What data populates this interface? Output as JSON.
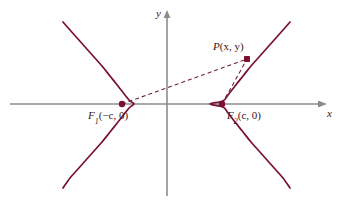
{
  "figure": {
    "background_color": "#ffffff",
    "curve_color": "#7a1030",
    "axis_color": "#8c8c8c",
    "dash_color": "#6b2233",
    "point_color": "#7a1030",
    "label_color": "#3a1520"
  },
  "axes": {
    "x_label": "x",
    "y_label": "y",
    "origin": {
      "x": 167,
      "y": 104
    },
    "x_axis": {
      "x1": 10,
      "x2": 322,
      "y": 104
    },
    "y_axis": {
      "x": 167,
      "y1": 12,
      "y2": 196
    }
  },
  "labels": {
    "focus_left": {
      "name": "F",
      "subscript": "1",
      "coords": "(−c, 0)",
      "full": "F₁(−c, 0)"
    },
    "focus_right": {
      "name": "F",
      "subscript": "2",
      "coords": "(c, 0)",
      "full": "F₂(c, 0)"
    },
    "point_p": {
      "name": "P",
      "coords": "(x, y)",
      "full": "P(x, y)"
    }
  },
  "points": [
    {
      "id": "F1",
      "label": "F₁(−c, 0)",
      "px": 122,
      "py": 104,
      "radius": 3.2
    },
    {
      "id": "F2",
      "label": "F₂(c, 0)",
      "px": 222,
      "py": 104,
      "radius": 3.2
    },
    {
      "id": "P",
      "label": "P(x, y)",
      "px": 247,
      "py": 59,
      "radius": 3.2
    }
  ],
  "chart_data": {
    "type": "line",
    "xlabel": "x",
    "ylabel": "y",
    "grid": false,
    "legend": null,
    "annotations": [
      {
        "text": "F₁(−c, 0)",
        "x": -1.45,
        "y": 0
      },
      {
        "text": "F₂(c, 0)",
        "x": 1.45,
        "y": 0
      },
      {
        "text": "P(x, y)",
        "x": 2.05,
        "y": 1.32
      },
      {
        "text": "x",
        "x": 4.6,
        "y": -0.18
      },
      {
        "text": "y",
        "x": -0.22,
        "y": 2.75
      }
    ],
    "series": [
      {
        "name": "left branch",
        "equation": "x^2/a^2 - y^2/b^2 = 1, x <= -a",
        "a": 0.97,
        "b": 1.08,
        "vertex": {
          "x": -0.97,
          "y": 0
        },
        "px_points": [
          [
            63,
            22
          ],
          [
            70,
            30
          ],
          [
            78,
            39
          ],
          [
            86,
            48
          ],
          [
            94,
            57
          ],
          [
            102,
            66
          ],
          [
            110,
            76
          ],
          [
            118,
            86
          ],
          [
            125,
            95
          ],
          [
            130,
            101
          ],
          [
            134,
            104
          ],
          [
            130,
            107
          ],
          [
            125,
            113
          ],
          [
            118,
            122
          ],
          [
            110,
            132
          ],
          [
            102,
            142
          ],
          [
            94,
            151
          ],
          [
            86,
            160
          ],
          [
            78,
            169
          ],
          [
            70,
            178
          ],
          [
            63,
            188
          ]
        ]
      },
      {
        "name": "right branch",
        "equation": "x^2/a^2 - y^2/b^2 = 1, x >= a",
        "a": 0.97,
        "b": 1.08,
        "vertex": {
          "x": 0.97,
          "y": 0
        },
        "px_points": [
          [
            290,
            22
          ],
          [
            283,
            30
          ],
          [
            275,
            39
          ],
          [
            267,
            48
          ],
          [
            259,
            57
          ],
          [
            251,
            66
          ],
          [
            243,
            76
          ],
          [
            235,
            86
          ],
          [
            228,
            95
          ],
          [
            223,
            101
          ],
          [
            210,
            104
          ],
          [
            223,
            107
          ],
          [
            228,
            113
          ],
          [
            235,
            122
          ],
          [
            243,
            132
          ],
          [
            251,
            142
          ],
          [
            259,
            151
          ],
          [
            267,
            160
          ],
          [
            275,
            169
          ],
          [
            283,
            178
          ],
          [
            290,
            188
          ]
        ]
      }
    ],
    "focal_radii": [
      {
        "name": "F1P",
        "style": "dashed",
        "from": [
          122,
          104
        ],
        "to": [
          247,
          59
        ]
      },
      {
        "name": "F2P",
        "style": "dashed",
        "from": [
          222,
          104
        ],
        "to": [
          247,
          59
        ]
      }
    ],
    "foci": [
      {
        "name": "F1",
        "x": -1.45,
        "y": 0
      },
      {
        "name": "F2",
        "x": 1.45,
        "y": 0
      }
    ],
    "xlim": [
      -5.2,
      4.9
    ],
    "ylim": [
      -2.9,
      2.9
    ]
  }
}
